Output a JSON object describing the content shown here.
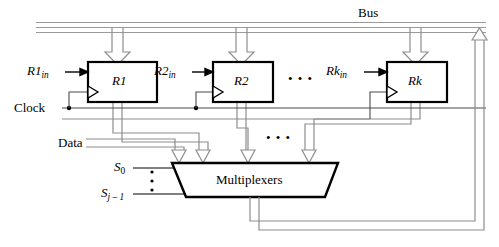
{
  "figure": {
    "kind": "register-file-bus-diagram",
    "bus_label": "Bus",
    "clock_label": "Clock",
    "data_label": "Data",
    "mux_label": "Multiplexers",
    "ellipsis_glyph": "• • •",
    "vertical_ellipsis_glyph": "⋮"
  },
  "registers": [
    {
      "name": "R1",
      "base": "R1",
      "control_base": "R1",
      "control_sub": "in",
      "control_label": "R1in"
    },
    {
      "name": "R2",
      "base": "R2",
      "control_base": "R2",
      "control_sub": "in",
      "control_label": "R2in"
    },
    {
      "name": "Rk",
      "base": "Rk",
      "control_base": "Rk",
      "control_sub": "in",
      "control_label": "Rkin"
    }
  ],
  "select_lines": [
    {
      "base": "S",
      "sub": "0",
      "label": "S0"
    },
    {
      "base": "S",
      "sub": "j – 1",
      "label": "Sj-1"
    }
  ],
  "colors": {
    "bus_line": "#9a9a9a",
    "box_stroke": "#000000",
    "text": "#000000",
    "background": "#ffffff",
    "wire_outline": "#8e8e8e"
  },
  "counts": {
    "register_count_shown": 3,
    "mux_inputs_shown": 4,
    "select_lines_shown": 2
  }
}
